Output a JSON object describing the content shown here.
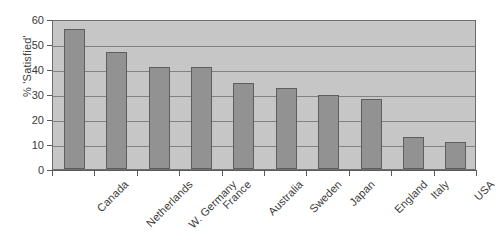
{
  "chart_data": {
    "type": "bar",
    "title": "",
    "subtitle": "",
    "xlabel": "",
    "ylabel": "% 'Satisfied'",
    "categories": [
      "Canada",
      "Netherlands",
      "W. Germany",
      "France",
      "Australia",
      "Sweden",
      "Japan",
      "England",
      "Italy",
      "USA"
    ],
    "values": [
      56,
      47,
      41,
      41,
      34.5,
      32.5,
      29.5,
      28,
      13,
      11
    ],
    "ylim": [
      0,
      60
    ],
    "ytick_labels": [
      "0",
      "10",
      "20",
      "30",
      "40",
      "50",
      "60"
    ],
    "ytick_values": [
      0,
      10,
      20,
      30,
      40,
      50,
      60
    ],
    "grid": true,
    "grid_axis": "y",
    "legend": false,
    "legend_position": "none",
    "series": [
      {
        "name": "% 'Satisfied'",
        "values": [
          56,
          47,
          41,
          41,
          34.5,
          32.5,
          29.5,
          28,
          13,
          11
        ]
      }
    ]
  },
  "style": {
    "plot_background": "#c6c6c6",
    "bar_fill": "#929292",
    "bar_border": "#5e5e5e",
    "gridline_color": "#828282",
    "axis_color": "#5a5a5a",
    "text_color": "#3a3a3a",
    "page_background": "#ffffff"
  }
}
